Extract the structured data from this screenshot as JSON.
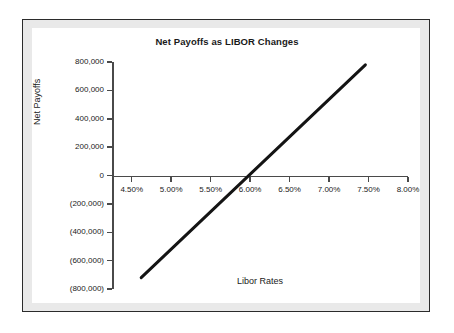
{
  "chart_data": {
    "type": "line",
    "title": "Net Payoffs as LIBOR Changes",
    "xlabel": "Libor Rates",
    "ylabel": "Net Payoffs",
    "grid": false,
    "legend": null,
    "xlim": [
      4.25,
      8.0
    ],
    "ylim": [
      -800000,
      800000
    ],
    "xtick_labels": [
      "4.50%",
      "5.00%",
      "5.50%",
      "6.00%",
      "6.50%",
      "7.00%",
      "7.50%",
      "8.00%"
    ],
    "xtick_values": [
      4.5,
      5.0,
      5.5,
      6.0,
      6.5,
      7.0,
      7.5,
      8.0
    ],
    "ytick_labels": [
      "800,000",
      "600,000",
      "400,000",
      "200,000",
      "0",
      "(200,000)",
      "(400,000)",
      "(600,000)",
      "(800,000)"
    ],
    "ytick_values": [
      800000,
      600000,
      400000,
      200000,
      0,
      -200000,
      -400000,
      -600000,
      -800000
    ],
    "series": [
      {
        "name": "Net Payoffs",
        "color": "#141414",
        "x": [
          4.62,
          7.46
        ],
        "values": [
          -720000,
          780000
        ],
        "zero_crossing_x": 5.93
      }
    ]
  },
  "style": {
    "frame_border_color": "#2b2b2b",
    "frame_band_color": "#e9e9e9",
    "canvas_color": "#ffffff",
    "axis_color": "#4a4a4a",
    "text_color": "#222222"
  }
}
